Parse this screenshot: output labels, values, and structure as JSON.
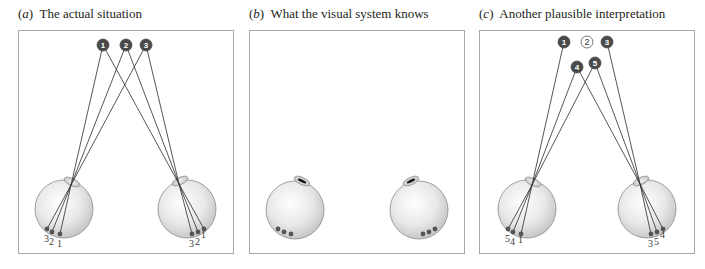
{
  "panels": [
    {
      "id": "a",
      "letter": "a",
      "title": "The actual situation",
      "frame": {
        "x": 18,
        "y": 30,
        "w": 215,
        "h": 223
      },
      "eyes": [
        {
          "cx": 64,
          "cy": 209,
          "r": 29,
          "lens": {
            "cx": 72,
            "cy": 182,
            "rot": 25
          },
          "node": [
            71,
            185
          ],
          "retina": [
            [
              47,
              229
            ],
            [
              52,
              232
            ],
            [
              60,
              234
            ]
          ],
          "labels": [
            "3",
            "2",
            "1"
          ]
        },
        {
          "cx": 187,
          "cy": 209,
          "r": 29,
          "lens": {
            "cx": 180,
            "cy": 181,
            "rot": -25
          },
          "node": [
            179,
            184
          ],
          "retina": [
            [
              192,
              234
            ],
            [
              198,
              232
            ],
            [
              204,
              229
            ]
          ],
          "labels": [
            "3",
            "2",
            "1"
          ]
        }
      ],
      "points": [
        {
          "id": "1",
          "x": 103,
          "y": 45,
          "filled": true
        },
        {
          "id": "2",
          "x": 126,
          "y": 45,
          "filled": true
        },
        {
          "id": "3",
          "x": 146,
          "y": 45,
          "filled": true
        }
      ],
      "rays": [
        {
          "point": "1",
          "eye": 0,
          "dot": 2
        },
        {
          "point": "2",
          "eye": 0,
          "dot": 1
        },
        {
          "point": "3",
          "eye": 0,
          "dot": 0
        },
        {
          "point": "1",
          "eye": 1,
          "dot": 2
        },
        {
          "point": "2",
          "eye": 1,
          "dot": 1
        },
        {
          "point": "3",
          "eye": 1,
          "dot": 0
        }
      ]
    },
    {
      "id": "b",
      "letter": "b",
      "title": "What the visual system knows",
      "frame": {
        "x": 249,
        "y": 30,
        "w": 215,
        "h": 223
      },
      "eyes": [
        {
          "cx": 295,
          "cy": 210,
          "r": 29,
          "lens": {
            "cx": 302,
            "cy": 181,
            "rot": 25
          },
          "pupil": true,
          "retina": [
            [
              278,
              229
            ],
            [
              284,
              232
            ],
            [
              291,
              234
            ]
          ],
          "labels": []
        },
        {
          "cx": 419,
          "cy": 210,
          "r": 29,
          "lens": {
            "cx": 411,
            "cy": 181,
            "rot": -25
          },
          "pupil": true,
          "retina": [
            [
              423,
              234
            ],
            [
              429,
              232
            ],
            [
              435,
              229
            ]
          ],
          "labels": []
        }
      ],
      "points": [],
      "rays": []
    },
    {
      "id": "c",
      "letter": "c",
      "title": "Another plausible interpretation",
      "frame": {
        "x": 479,
        "y": 30,
        "w": 215,
        "h": 223
      },
      "eyes": [
        {
          "cx": 527,
          "cy": 209,
          "r": 29,
          "lens": {
            "cx": 533,
            "cy": 182,
            "rot": 25
          },
          "node": [
            532,
            185
          ],
          "retina": [
            [
              508,
              229
            ],
            [
              513,
              232
            ],
            [
              521,
              234
            ]
          ],
          "labels": [
            "5",
            "4",
            "1"
          ]
        },
        {
          "cx": 647,
          "cy": 209,
          "r": 29,
          "lens": {
            "cx": 641,
            "cy": 181,
            "rot": -25
          },
          "node": [
            640,
            184
          ],
          "retina": [
            [
              651,
              234
            ],
            [
              657,
              232
            ],
            [
              663,
              229
            ]
          ],
          "labels": [
            "3",
            "5",
            "4"
          ]
        }
      ],
      "points": [
        {
          "id": "1",
          "x": 564,
          "y": 42,
          "filled": true
        },
        {
          "id": "2",
          "x": 587,
          "y": 42,
          "filled": false
        },
        {
          "id": "3",
          "x": 607,
          "y": 42,
          "filled": true
        },
        {
          "id": "4",
          "x": 577,
          "y": 67,
          "filled": true
        },
        {
          "id": "5",
          "x": 595,
          "y": 63,
          "filled": true
        }
      ],
      "rays": [
        {
          "point": "1",
          "eye": 0,
          "dot": 2
        },
        {
          "point": "4",
          "eye": 0,
          "dot": 1
        },
        {
          "point": "5",
          "eye": 0,
          "dot": 0
        },
        {
          "point": "3",
          "eye": 1,
          "dot": 0
        },
        {
          "point": "5",
          "eye": 1,
          "dot": 1
        },
        {
          "point": "4",
          "eye": 1,
          "dot": 2
        }
      ]
    }
  ],
  "colors": {
    "frame": "#a8a8a8",
    "eye_outline": "#8a8a8a",
    "eye_fill_light": "#ffffff",
    "eye_fill_dark": "#c9c9c9",
    "point_fill": "#4a4a4a",
    "ray": "#2b2b2b",
    "retina_dot": "#555555"
  }
}
